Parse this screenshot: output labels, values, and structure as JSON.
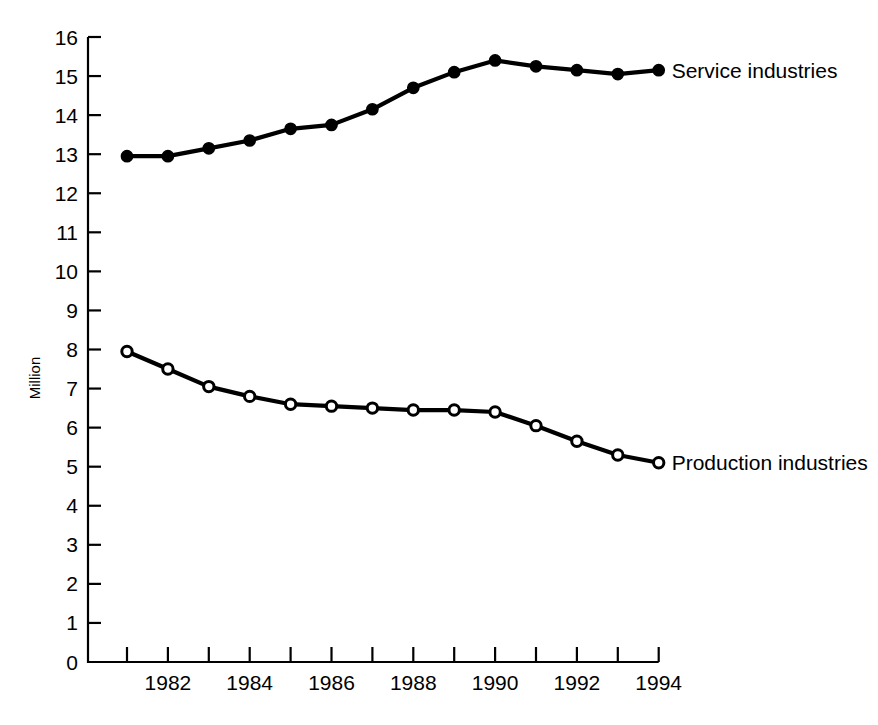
{
  "chart_data": {
    "type": "line",
    "title": "",
    "xlabel": "",
    "ylabel": "Million",
    "xlim": [
      1981,
      1994
    ],
    "ylim": [
      0,
      16
    ],
    "grid": false,
    "legend_position": "inline-right-of-series",
    "x": [
      1981,
      1982,
      1983,
      1984,
      1985,
      1986,
      1987,
      1988,
      1989,
      1990,
      1991,
      1992,
      1993,
      1994
    ],
    "x_tick_labels": [
      "",
      "1982",
      "",
      "1984",
      "",
      "1986",
      "",
      "1988",
      "",
      "1990",
      "",
      "1992",
      "",
      "1994"
    ],
    "y_ticks": [
      0,
      1,
      2,
      3,
      4,
      5,
      6,
      7,
      8,
      9,
      10,
      11,
      12,
      13,
      14,
      15,
      16
    ],
    "y_tick_labels": [
      "0",
      "1",
      "2",
      "3",
      "4",
      "5",
      "6",
      "7",
      "8",
      "9",
      "10",
      "11",
      "12",
      "13",
      "14",
      "15",
      "16"
    ],
    "series": [
      {
        "name": "Service industries",
        "marker": "filled-circle",
        "color": "#000000",
        "values": [
          12.95,
          12.95,
          13.15,
          13.35,
          13.65,
          13.75,
          14.15,
          14.7,
          15.1,
          15.4,
          15.25,
          15.15,
          15.05,
          15.15
        ]
      },
      {
        "name": "Production industries",
        "marker": "open-circle",
        "color": "#000000",
        "values": [
          7.95,
          7.5,
          7.05,
          6.8,
          6.6,
          6.55,
          6.5,
          6.45,
          6.45,
          6.4,
          6.05,
          5.65,
          5.3,
          5.1
        ]
      }
    ]
  },
  "labels": {
    "series_service": "Service industries",
    "series_production": "Production industries",
    "y_axis_title": "Million"
  }
}
